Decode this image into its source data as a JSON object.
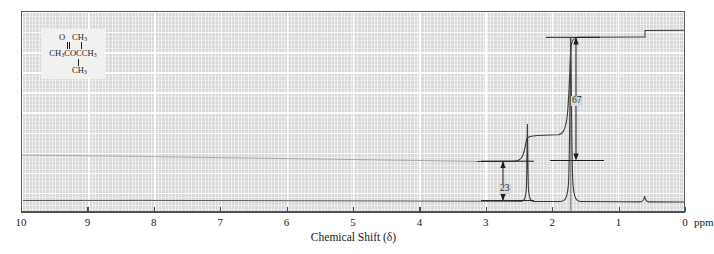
{
  "figure": {
    "type": "nmr-spectrum",
    "axis_title": "Chemical Shift (δ)",
    "unit_label": "ppm"
  },
  "structure": {
    "caption": "CH3COCCH3 with O and two CH3 substituents",
    "top_o": "O",
    "top_ch3": "CH3",
    "main_chain": "CH3COCCH3",
    "bottom_ch3": "CH3",
    "o_sub": "3",
    "main_parts": {
      "a": "CH",
      "a_sub": "3",
      "b": "COCC",
      "c": "H",
      "c_sub": "3"
    }
  },
  "annotations": {
    "integral_upper": "67",
    "integral_lower": "23"
  },
  "chart_data": {
    "type": "line",
    "title": "",
    "xlabel": "Chemical Shift (δ)",
    "ylabel": "",
    "xlim": [
      10,
      0
    ],
    "xtick_labels": [
      "10",
      "9",
      "8",
      "7",
      "6",
      "5",
      "4",
      "3",
      "2",
      "1",
      "0"
    ],
    "xticks": [
      10,
      9,
      8,
      7,
      6,
      5,
      4,
      3,
      2,
      1,
      0
    ],
    "grid": true,
    "legend": false,
    "axis_direction": "reversed",
    "series": [
      {
        "name": "spectrum",
        "peaks": [
          {
            "shift": 2.12,
            "relative_height": 0.46,
            "width": 0.035,
            "assignment": "CH3CO"
          },
          {
            "shift": 1.4,
            "relative_height": 0.97,
            "width": 0.03,
            "assignment": "C(CH3)2"
          },
          {
            "shift": 0.0,
            "relative_height": 0.035,
            "width": 0.025,
            "assignment": "TMS"
          }
        ],
        "baseline": 0.0
      },
      {
        "name": "integral-trace",
        "steps": [
          {
            "shift": 2.12,
            "rise": 23,
            "label": "23"
          },
          {
            "shift": 1.4,
            "rise": 67,
            "label": "67"
          }
        ]
      }
    ],
    "integration_values": [
      23,
      67
    ],
    "integration_ratio": "23 : 67"
  }
}
